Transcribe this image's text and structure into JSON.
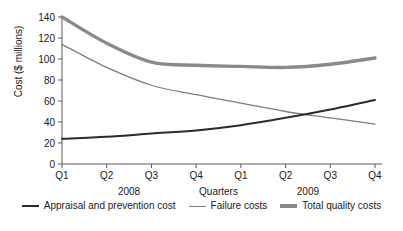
{
  "chart_data": {
    "type": "line",
    "title": "",
    "xlabel": "Quarters",
    "ylabel": "Cost ($ millions)",
    "categories": [
      "Q1",
      "Q2",
      "Q3",
      "Q4",
      "Q1",
      "Q2",
      "Q3",
      "Q4"
    ],
    "group_labels": [
      {
        "text": "2008",
        "span": [
          "Q1",
          "Q4"
        ]
      },
      {
        "text": "Quarters",
        "span": [
          "Q4",
          "Q1"
        ]
      },
      {
        "text": "2009",
        "span": [
          "Q1",
          "Q4"
        ]
      }
    ],
    "ylim": [
      0,
      140
    ],
    "yticks": [
      0,
      20,
      40,
      60,
      80,
      100,
      120,
      140
    ],
    "grid": false,
    "legend_position": "bottom",
    "series": [
      {
        "name": "Appraisal and prevention cost",
        "values": [
          24,
          26,
          29,
          32,
          37,
          44,
          52,
          61
        ],
        "color": "#2b2b2b",
        "width": 2.0
      },
      {
        "name": "Failure costs",
        "values": [
          114,
          92,
          75,
          66,
          58,
          50,
          44,
          38
        ],
        "color": "#7d7d7d",
        "width": 1.3
      },
      {
        "name": "Total quality costs",
        "values": [
          140,
          115,
          97,
          94,
          93,
          92,
          95,
          101
        ],
        "color": "#8a8a8a",
        "width": 3.4
      }
    ]
  },
  "axis": {
    "y_title": "Cost ($ millions)",
    "y_tick_labels": [
      "0",
      "20",
      "40",
      "60",
      "80",
      "100",
      "120",
      "140"
    ],
    "x_tick_labels": [
      "Q1",
      "Q2",
      "Q3",
      "Q4",
      "Q1",
      "Q2",
      "Q3",
      "Q4"
    ],
    "group_2008": "2008",
    "group_center": "Quarters",
    "group_2009": "2009"
  },
  "legend": {
    "items": [
      {
        "label": "Appraisal and prevention cost",
        "color": "#2b2b2b",
        "thickness": "2px"
      },
      {
        "label": "Failure costs",
        "color": "#7d7d7d",
        "thickness": "1px"
      },
      {
        "label": "Total quality costs",
        "color": "#8a8a8a",
        "thickness": "4px"
      }
    ]
  }
}
